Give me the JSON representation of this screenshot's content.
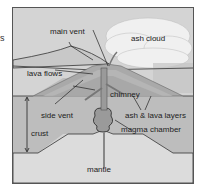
{
  "stray_text": "s",
  "diagram": {
    "labels": {
      "main_vent": "main vent",
      "ash_cloud": "ash cloud",
      "lava_flows": "lava flows",
      "chimney": "chimney",
      "side_vent": "side vent",
      "ash_lava_layers": "ash & lava layers",
      "crust": "crust",
      "magma_chamber": "magma chamber",
      "mantle": "mantle"
    },
    "colors": {
      "sky": "#d2d2d2",
      "crust": "#bdbdbd",
      "mantle": "#dcdcdc",
      "magma": "#9a9a9a",
      "cloud": "#eeeeee",
      "outline": "#222222"
    }
  }
}
